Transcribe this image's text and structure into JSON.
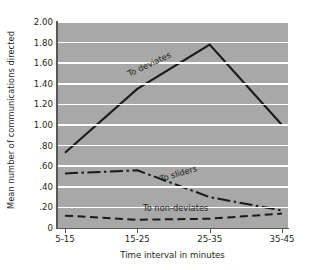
{
  "chart_data": {
    "type": "line",
    "title": "",
    "xlabel": "Time interval in minutes",
    "ylabel": "Mean number of communications directed",
    "categories": [
      "5-15",
      "15-25",
      "25-35",
      "35-45"
    ],
    "ylim": [
      0,
      2.0
    ],
    "ytick_labels": [
      "0",
      ".20",
      ".40",
      ".60",
      ".80",
      "1.00",
      "1.20",
      "1.40",
      "1.60",
      "1.80",
      "2.00"
    ],
    "ytick_values": [
      0,
      0.2,
      0.4,
      0.6,
      0.8,
      1.0,
      1.2,
      1.4,
      1.6,
      1.8,
      2.0
    ],
    "grid": true,
    "legend_position": "inline-annotations",
    "plot_background": "#a8a8a8",
    "gridline_color": "#ffffff",
    "series": [
      {
        "name": "To deviates",
        "style": "solid",
        "color": "#1a1a1a",
        "values": [
          0.73,
          1.35,
          1.78,
          1.0
        ]
      },
      {
        "name": "To sliders",
        "style": "dash-dot",
        "color": "#1a1a1a",
        "values": [
          0.53,
          0.56,
          0.3,
          0.17
        ]
      },
      {
        "name": "To non-deviates",
        "style": "dashed",
        "color": "#1a1a1a",
        "values": [
          0.12,
          0.08,
          0.09,
          0.14
        ]
      }
    ]
  }
}
